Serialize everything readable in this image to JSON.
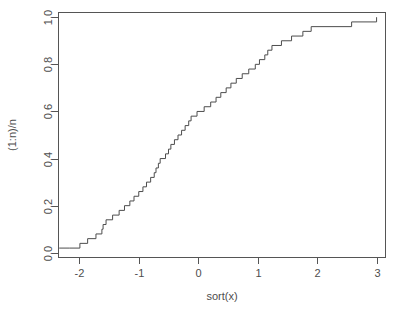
{
  "figure": {
    "background_color": "#ffffff",
    "line_color": "#4d4d4d",
    "axis_color": "#555555",
    "width": 401,
    "height": 314
  },
  "chart_data": {
    "type": "line",
    "subtype": "ecdf-step",
    "title": "",
    "subtitle": "",
    "xlabel": "sort(x)",
    "ylabel": "(1:n)/n",
    "xlim": [
      -2.35,
      3.15
    ],
    "ylim": [
      -0.02,
      1.02
    ],
    "grid": false,
    "legend": "none",
    "n": 50,
    "xticks": [
      -2,
      -1,
      0,
      1,
      2,
      3
    ],
    "xticklabels": [
      "-2",
      "-1",
      "0",
      "1",
      "2",
      "3"
    ],
    "yticks": [
      0.0,
      0.2,
      0.4,
      0.6,
      0.8,
      1.0
    ],
    "yticklabels": [
      "0.0",
      "0.2",
      "0.4",
      "0.6",
      "0.8",
      "1.0"
    ],
    "x": [
      -2.17,
      -1.99,
      -1.86,
      -1.72,
      -1.62,
      -1.6,
      -1.55,
      -1.44,
      -1.33,
      -1.24,
      -1.15,
      -1.08,
      -1.0,
      -0.93,
      -0.87,
      -0.8,
      -0.74,
      -0.71,
      -0.67,
      -0.64,
      -0.55,
      -0.5,
      -0.46,
      -0.4,
      -0.34,
      -0.28,
      -0.22,
      -0.16,
      -0.12,
      -0.02,
      0.1,
      0.21,
      0.3,
      0.38,
      0.47,
      0.55,
      0.64,
      0.74,
      0.85,
      0.96,
      1.03,
      1.12,
      1.17,
      1.24,
      1.4,
      1.57,
      1.76,
      1.9,
      2.58,
      3.0
    ],
    "y": [
      0.02,
      0.04,
      0.06,
      0.08,
      0.1,
      0.12,
      0.14,
      0.16,
      0.18,
      0.2,
      0.22,
      0.24,
      0.26,
      0.28,
      0.3,
      0.32,
      0.34,
      0.36,
      0.38,
      0.4,
      0.42,
      0.44,
      0.46,
      0.48,
      0.5,
      0.52,
      0.54,
      0.56,
      0.58,
      0.6,
      0.62,
      0.64,
      0.66,
      0.68,
      0.7,
      0.72,
      0.74,
      0.76,
      0.78,
      0.8,
      0.82,
      0.84,
      0.86,
      0.88,
      0.9,
      0.92,
      0.94,
      0.96,
      0.98,
      1.0
    ]
  }
}
